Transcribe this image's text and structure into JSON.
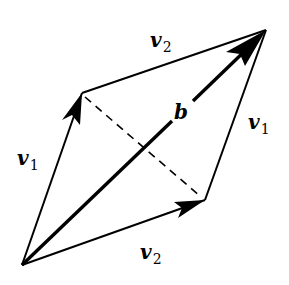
{
  "diagram": {
    "points": {
      "origin": [
        22,
        265
      ],
      "v1_tip": [
        82,
        93
      ],
      "v2_tip": [
        205,
        200
      ],
      "sum_tip": [
        266,
        30
      ]
    },
    "labels": {
      "v1_left": {
        "base": "v",
        "sub": "1"
      },
      "v1_right": {
        "base": "v",
        "sub": "1"
      },
      "v2_top": {
        "base": "v",
        "sub": "2"
      },
      "v2_bottom": {
        "base": "v",
        "sub": "2"
      },
      "b": "b"
    },
    "colors": {
      "stroke": "#000000",
      "background": "#ffffff"
    }
  }
}
